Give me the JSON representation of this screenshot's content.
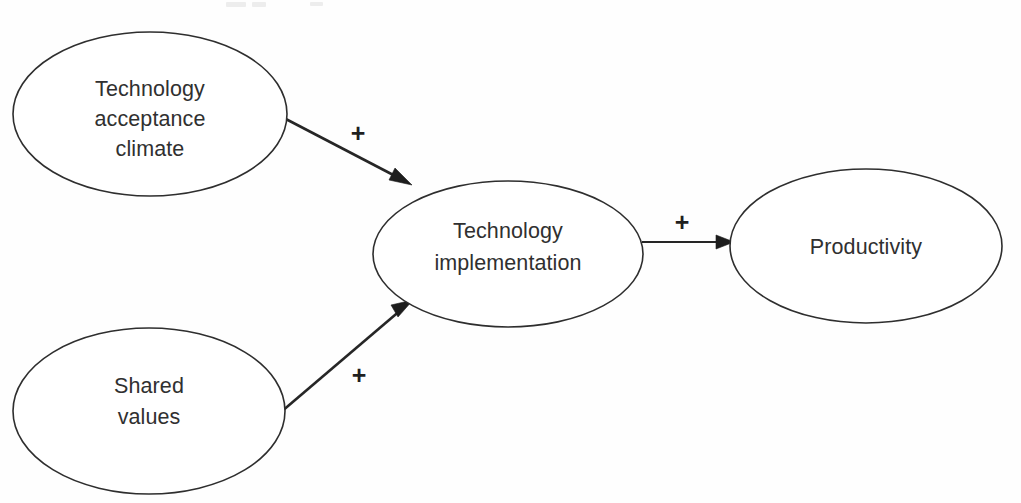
{
  "diagram": {
    "background_color": "#fefefe",
    "stroke_color": "#2e2e2e",
    "text_color": "#303030",
    "nodes": [
      {
        "id": "technology-acceptance-climate",
        "label_lines": [
          "Technology",
          "acceptance",
          "climate"
        ],
        "label": "Technology acceptance climate",
        "cx": 150,
        "cy": 114,
        "rx": 137,
        "ry": 82
      },
      {
        "id": "shared-values",
        "label_lines": [
          "Shared",
          "values"
        ],
        "label": "Shared values",
        "cx": 149,
        "cy": 411,
        "rx": 136,
        "ry": 83
      },
      {
        "id": "technology-implementation",
        "label_lines": [
          "Technology",
          "implementation"
        ],
        "label": "Technology implementation",
        "cx": 508,
        "cy": 254,
        "rx": 135,
        "ry": 73
      },
      {
        "id": "productivity",
        "label_lines": [
          "Productivity"
        ],
        "label": "Productivity",
        "cx": 866,
        "cy": 246,
        "rx": 136,
        "ry": 77
      }
    ],
    "edges": [
      {
        "id": "climate-to-implementation",
        "from": "technology-acceptance-climate",
        "to": "technology-implementation",
        "label": "+",
        "label_x": 358,
        "label_y": 142,
        "x1": 282,
        "y1": 117,
        "x2": 408,
        "y2": 184
      },
      {
        "id": "implementation-to-productivity",
        "from": "technology-implementation",
        "to": "productivity",
        "label": "+",
        "label_x": 682,
        "label_y": 231,
        "x1": 642,
        "y1": 242,
        "x2": 733,
        "y2": 242
      },
      {
        "id": "shared-values-to-implementation",
        "from": "shared-values",
        "to": "technology-implementation",
        "label": "+",
        "label_x": 359,
        "label_y": 384,
        "x1": 281,
        "y1": 412,
        "x2": 409,
        "y2": 303
      }
    ]
  }
}
